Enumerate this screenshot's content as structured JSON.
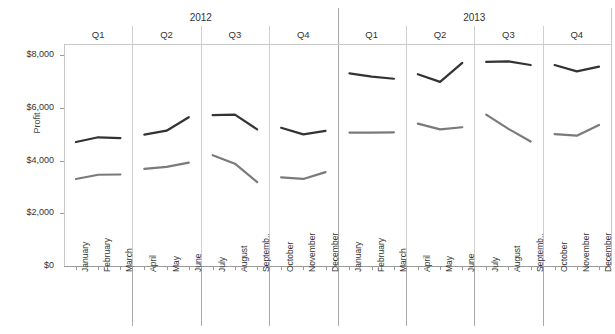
{
  "chart_data": {
    "type": "line",
    "title": "",
    "xlabel": "",
    "ylabel": "Profit",
    "ylim": [
      0,
      8000
    ],
    "y_ticks": [
      0,
      2000,
      4000,
      6000,
      8000
    ],
    "y_tick_labels": [
      "$0",
      "$2,000",
      "$4,000",
      "$6,000",
      "$8,000"
    ],
    "grid": false,
    "legend_position": "none",
    "panel_headers": {
      "level1": [
        "2012",
        "2013"
      ],
      "level2": [
        "Q1",
        "Q2",
        "Q3",
        "Q4",
        "Q1",
        "Q2",
        "Q3",
        "Q4"
      ]
    },
    "categories": [
      "January",
      "February",
      "March",
      "April",
      "May",
      "June",
      "July",
      "August",
      "Septemb..",
      "October",
      "November",
      "December",
      "January",
      "February",
      "March",
      "April",
      "May",
      "June",
      "July",
      "August",
      "Septemb..",
      "October",
      "November",
      "December"
    ],
    "series": [
      {
        "name": "series-dark",
        "color": "#333333",
        "values": [
          4700,
          4880,
          4850,
          4980,
          5130,
          5640,
          5720,
          5740,
          5180,
          5240,
          4990,
          5120,
          7300,
          7180,
          7100,
          7270,
          6980,
          7700,
          7740,
          7760,
          7620,
          7620,
          7380,
          7560
        ]
      },
      {
        "name": "series-gray",
        "color": "#7a7a7a",
        "values": [
          3300,
          3460,
          3470,
          3680,
          3760,
          3920,
          4200,
          3880,
          3180,
          3360,
          3300,
          3560,
          5060,
          5060,
          5070,
          5400,
          5180,
          5260,
          5740,
          5200,
          4720,
          5000,
          4940,
          5350
        ]
      }
    ]
  }
}
